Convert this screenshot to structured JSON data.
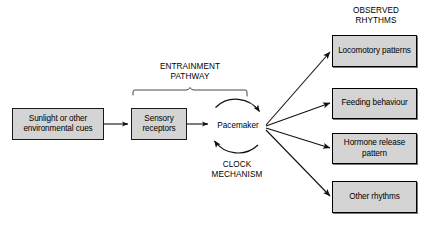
{
  "diagram": {
    "title_text_right": "OBSERVED\nRHYTHMS",
    "entrainment_label": "ENTRAINMENT\nPATHWAY",
    "clock_label": "CLOCK\nMECHANISM",
    "pacemaker_label": "Pacemaker",
    "colors": {
      "box_fill": "#d4d4d4",
      "box_stroke": "#000000",
      "line": "#1a1a1a",
      "background": "#ffffff",
      "text": "#000000"
    },
    "input_nodes": [
      {
        "id": "sunlight",
        "label": "Sunlight or other\nenvironmental cues"
      },
      {
        "id": "sensory",
        "label": "Sensory\nreceptors"
      }
    ],
    "output_nodes": [
      {
        "id": "locomotory",
        "label": "Locomotory\npatterns"
      },
      {
        "id": "feeding",
        "label": "Feeding\nbehaviour"
      },
      {
        "id": "hormone",
        "label": "Hormone release\npattern"
      },
      {
        "id": "other",
        "label": "Other\nrhythms"
      }
    ]
  }
}
